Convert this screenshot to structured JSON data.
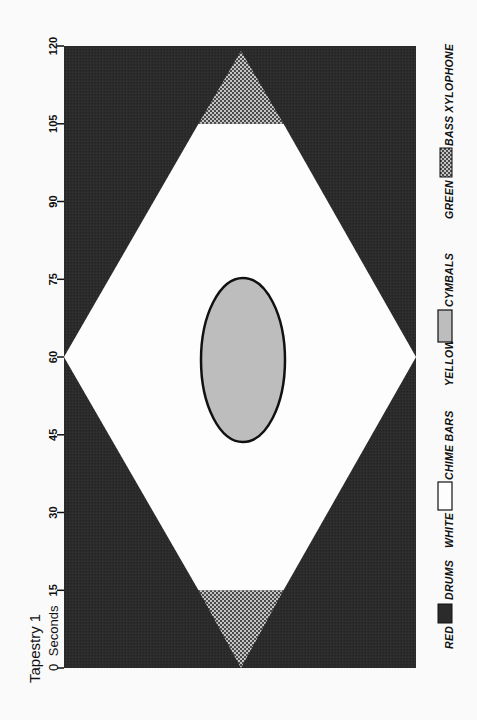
{
  "title": "Tapestry 1",
  "axis": {
    "unit_label": "Seconds",
    "ticks": [
      "0",
      "15",
      "30",
      "45",
      "60",
      "75",
      "90",
      "105",
      "120"
    ]
  },
  "legend": [
    {
      "color_name": "RED",
      "instrument": "DRUMS"
    },
    {
      "color_name": "WHITE",
      "instrument": "CHIME BARS"
    },
    {
      "color_name": "YELLOW",
      "instrument": "CYMBALS"
    },
    {
      "color_name": "GREEN",
      "instrument": "BASS XYLOPHONE"
    }
  ],
  "colors": {
    "red": "#2b2b2b",
    "white": "#fdfdfd",
    "yellow": "#bdbdbd",
    "green_dark": "#4a4a4a",
    "green_light": "#c4c4c4",
    "outline": "#111111",
    "background": "#fafafa"
  },
  "score_regions": [
    {
      "instrument": "DRUMS",
      "color": "RED",
      "shape": "background surrounding diamond",
      "start_s": 0,
      "end_s": 120
    },
    {
      "instrument": "BASS XYLOPHONE",
      "color": "GREEN",
      "shape": "triangle (diamond tip)",
      "start_s": 0,
      "end_s": 15
    },
    {
      "instrument": "CHIME BARS",
      "color": "WHITE",
      "shape": "diamond body",
      "start_s": 15,
      "end_s": 105,
      "widest_at_s": 60
    },
    {
      "instrument": "CYMBALS",
      "color": "YELLOW",
      "shape": "ellipse",
      "start_s": 45,
      "end_s": 75
    },
    {
      "instrument": "BASS XYLOPHONE",
      "color": "GREEN",
      "shape": "triangle (diamond tip)",
      "start_s": 105,
      "end_s": 120
    }
  ]
}
